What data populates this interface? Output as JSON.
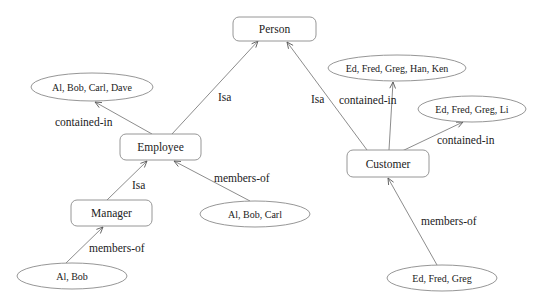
{
  "diagram": {
    "colors": {
      "stroke": "#8a8a8a",
      "edge": "#6e6e6e",
      "text": "#222222",
      "background": "#ffffff"
    },
    "classes": [
      {
        "id": "person",
        "label": "Person",
        "x": 233,
        "y": 17,
        "w": 83,
        "h": 24
      },
      {
        "id": "employee",
        "label": "Employee",
        "x": 120,
        "y": 134,
        "w": 81,
        "h": 26
      },
      {
        "id": "manager",
        "label": "Manager",
        "x": 71,
        "y": 200,
        "w": 81,
        "h": 26
      },
      {
        "id": "customer",
        "label": "Customer",
        "x": 347,
        "y": 150,
        "w": 82,
        "h": 27
      }
    ],
    "sets": [
      {
        "id": "set-al-bob-carl-dave",
        "label": "Al, Bob, Carl, Dave",
        "cx": 92,
        "cy": 87,
        "rx": 61,
        "ry": 14
      },
      {
        "id": "set-ed-fred-greg-han-ken",
        "label": "Ed, Fred, Greg, Han, Ken",
        "cx": 397,
        "cy": 68,
        "rx": 69,
        "ry": 13
      },
      {
        "id": "set-ed-fred-greg-li",
        "label": "Ed, Fred, Greg, Li",
        "cx": 472,
        "cy": 109,
        "rx": 54,
        "ry": 13
      },
      {
        "id": "set-al-bob-carl",
        "label": "Al, Bob, Carl",
        "cx": 255,
        "cy": 214,
        "rx": 55,
        "ry": 13
      },
      {
        "id": "set-al-bob",
        "label": "Al, Bob",
        "cx": 72,
        "cy": 276,
        "rx": 55,
        "ry": 13
      },
      {
        "id": "set-ed-fred-greg",
        "label": "Ed, Fred, Greg",
        "cx": 442,
        "cy": 278,
        "rx": 55,
        "ry": 13
      }
    ],
    "edges": [
      {
        "id": "employee-isa-person",
        "from": "Employee",
        "to": "Person",
        "label": "Isa",
        "x1": 172,
        "y1": 134,
        "x2": 258,
        "y2": 41,
        "lx": 218,
        "ly": 101
      },
      {
        "id": "customer-isa-person",
        "from": "Customer",
        "to": "Person",
        "label": "Isa",
        "x1": 367,
        "y1": 150,
        "x2": 287,
        "y2": 42,
        "lx": 311,
        "ly": 103
      },
      {
        "id": "employee-contained-in",
        "from": "Employee",
        "to": "Al, Bob, Carl, Dave",
        "label": "contained-in",
        "x1": 152,
        "y1": 134,
        "x2": 95,
        "y2": 102,
        "lx": 55,
        "ly": 126
      },
      {
        "id": "customer-contained-in-top",
        "from": "Customer",
        "to": "Ed, Fred, Greg, Han, Ken",
        "label": "contained-in",
        "x1": 389,
        "y1": 150,
        "x2": 393,
        "y2": 82,
        "lx": 339,
        "ly": 104
      },
      {
        "id": "customer-contained-in-right",
        "from": "Customer",
        "to": "Ed, Fred, Greg, Li",
        "label": "contained-in",
        "x1": 400,
        "y1": 152,
        "x2": 463,
        "y2": 122,
        "lx": 437,
        "ly": 144
      },
      {
        "id": "manager-isa-employee",
        "from": "Manager",
        "to": "Employee",
        "label": "Isa",
        "x1": 107,
        "y1": 200,
        "x2": 147,
        "y2": 161,
        "lx": 132,
        "ly": 189
      },
      {
        "id": "al-bob-carl-members-of",
        "from": "Al, Bob, Carl",
        "to": "Employee",
        "label": "members-of",
        "x1": 250,
        "y1": 201,
        "x2": 174,
        "y2": 161,
        "lx": 214,
        "ly": 182
      },
      {
        "id": "al-bob-members-of",
        "from": "Al, Bob",
        "to": "Manager",
        "label": "members-of",
        "x1": 66,
        "y1": 263,
        "x2": 103,
        "y2": 227,
        "lx": 89,
        "ly": 252
      },
      {
        "id": "ed-fred-greg-members-of",
        "from": "Ed, Fred, Greg",
        "to": "Customer",
        "label": "members-of",
        "x1": 437,
        "y1": 265,
        "x2": 388,
        "y2": 178,
        "lx": 421,
        "ly": 225
      }
    ]
  }
}
